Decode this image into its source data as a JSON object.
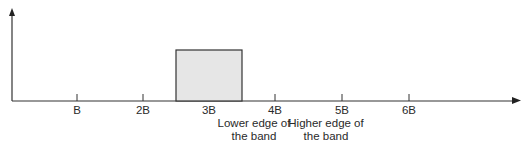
{
  "diagram": {
    "type": "frequency-spectrum",
    "axis_ticks": [
      {
        "label": "B",
        "x": 77
      },
      {
        "label": "2B",
        "x": 143
      },
      {
        "label": "3B",
        "x": 209
      },
      {
        "label": "4B",
        "x": 275
      },
      {
        "label": "5B",
        "x": 342
      },
      {
        "label": "6B",
        "x": 409
      }
    ],
    "band": {
      "from": "2.5B",
      "to": "3.5B",
      "fill": "#e6e6e6",
      "stroke": "#333333"
    },
    "annotations": {
      "lower_edge": {
        "line1": "Lower edge of",
        "line2": "the band"
      },
      "higher_edge": {
        "line1": "Higher edge of",
        "line2": "the band"
      }
    },
    "colors": {
      "axis": "#333333"
    }
  }
}
